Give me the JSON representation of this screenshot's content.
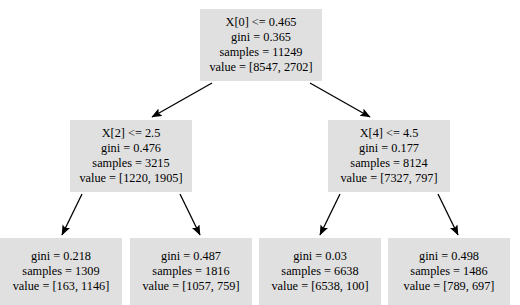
{
  "diagram": {
    "type": "decision-tree",
    "node_fill": "#e0e0e0",
    "edge_color": "#000000",
    "background": "#ffffff",
    "nodes": [
      {
        "id": "root",
        "level": 0,
        "condition": "X[0] <= 0.465",
        "gini": "gini = 0.365",
        "samples": "samples = 11249",
        "value": "value = [8547, 2702]",
        "box": {
          "x": 200,
          "y": 9,
          "w": 122,
          "h": 72
        }
      },
      {
        "id": "left",
        "level": 1,
        "condition": "X[2] <= 2.5",
        "gini": "gini = 0.476",
        "samples": "samples = 3215",
        "value": "value = [1220, 1905]",
        "box": {
          "x": 70,
          "y": 120,
          "w": 122,
          "h": 72
        }
      },
      {
        "id": "right",
        "level": 1,
        "condition": "X[4] <= 4.5",
        "gini": "gini = 0.177",
        "samples": "samples = 8124",
        "value": "value = [7327, 797]",
        "box": {
          "x": 328,
          "y": 120,
          "w": 122,
          "h": 72
        }
      },
      {
        "id": "leaf1",
        "level": 2,
        "condition": "",
        "gini": "gini = 0.218",
        "samples": "samples = 1309",
        "value": "value = [163, 1146]",
        "box": {
          "x": 0,
          "y": 238,
          "w": 122,
          "h": 67
        }
      },
      {
        "id": "leaf2",
        "level": 2,
        "condition": "",
        "gini": "gini = 0.487",
        "samples": "samples = 1816",
        "value": "value = [1057, 759]",
        "box": {
          "x": 130,
          "y": 238,
          "w": 122,
          "h": 67
        }
      },
      {
        "id": "leaf3",
        "level": 2,
        "condition": "",
        "gini": "gini = 0.03",
        "samples": "samples = 6638",
        "value": "value = [6538, 100]",
        "box": {
          "x": 259,
          "y": 238,
          "w": 122,
          "h": 67
        }
      },
      {
        "id": "leaf4",
        "level": 2,
        "condition": "",
        "gini": "gini = 0.498",
        "samples": "samples = 1486",
        "value": "value = [789, 697]",
        "box": {
          "x": 388,
          "y": 238,
          "w": 122,
          "h": 67
        }
      }
    ],
    "edges": [
      {
        "from": "root",
        "to": "left",
        "x1": 212,
        "y1": 83,
        "x2": 152,
        "y2": 117
      },
      {
        "from": "root",
        "to": "right",
        "x1": 310,
        "y1": 83,
        "x2": 370,
        "y2": 117
      },
      {
        "from": "left",
        "to": "leaf1",
        "x1": 82,
        "y1": 194,
        "x2": 62,
        "y2": 235
      },
      {
        "from": "left",
        "to": "leaf2",
        "x1": 180,
        "y1": 194,
        "x2": 200,
        "y2": 235
      },
      {
        "from": "right",
        "to": "leaf3",
        "x1": 340,
        "y1": 194,
        "x2": 320,
        "y2": 235
      },
      {
        "from": "right",
        "to": "leaf4",
        "x1": 438,
        "y1": 194,
        "x2": 458,
        "y2": 235
      }
    ]
  }
}
